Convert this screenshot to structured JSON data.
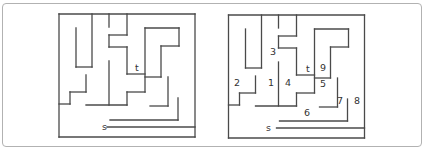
{
  "page": {
    "width": 425,
    "height": 150,
    "background_color": "#ffffff",
    "border_color": "#b2b2b2"
  },
  "figure": {
    "wall_color": "#4a4a4a",
    "wall_width": 1.3,
    "label_color": "#333333",
    "label_font_size": 9.5,
    "walls": [
      [
        59,
        14,
        195,
        14
      ],
      [
        59,
        14,
        59,
        137
      ],
      [
        195,
        14,
        195,
        137
      ],
      [
        59,
        137,
        195,
        137
      ],
      [
        76,
        28,
        76,
        67
      ],
      [
        92,
        14,
        92,
        67
      ],
      [
        76,
        67,
        92,
        67
      ],
      [
        109,
        14,
        109,
        27
      ],
      [
        127,
        14,
        127,
        35
      ],
      [
        109,
        35,
        127,
        35
      ],
      [
        109,
        35,
        109,
        47
      ],
      [
        109,
        47,
        127,
        47
      ],
      [
        127,
        47,
        127,
        74
      ],
      [
        109,
        61,
        109,
        105
      ],
      [
        127,
        74,
        145,
        74
      ],
      [
        145,
        28,
        145,
        92
      ],
      [
        145,
        28,
        179,
        28
      ],
      [
        179,
        28,
        179,
        46
      ],
      [
        161,
        46,
        179,
        46
      ],
      [
        161,
        46,
        161,
        77
      ],
      [
        145,
        77,
        161,
        77
      ],
      [
        70,
        92,
        86,
        92
      ],
      [
        86,
        75,
        86,
        92
      ],
      [
        70,
        92,
        70,
        104
      ],
      [
        59,
        104,
        70,
        104
      ],
      [
        86,
        105,
        127,
        105
      ],
      [
        127,
        92,
        127,
        105
      ],
      [
        127,
        92,
        145,
        92
      ],
      [
        150,
        106,
        168,
        106
      ],
      [
        168,
        77,
        168,
        106
      ],
      [
        110,
        120,
        178,
        120
      ],
      [
        178,
        98,
        178,
        120
      ],
      [
        107,
        127,
        195,
        127
      ]
    ],
    "left_maze": {
      "name": "maze-unlabeled",
      "dx": 0,
      "dy": 0,
      "labels": [
        {
          "id": "label-t-left",
          "text": "t",
          "x": 135,
          "y": 71
        },
        {
          "id": "label-s-left",
          "text": "s",
          "x": 102,
          "y": 130
        }
      ]
    },
    "right_maze": {
      "name": "maze-numbered",
      "dx": 169.5,
      "dy": 1,
      "labels": [
        {
          "id": "label-3",
          "text": "3",
          "x": 270,
          "y": 55
        },
        {
          "id": "label-2",
          "text": "2",
          "x": 234,
          "y": 86
        },
        {
          "id": "label-1",
          "text": "1",
          "x": 268,
          "y": 86
        },
        {
          "id": "label-4",
          "text": "4",
          "x": 285,
          "y": 86
        },
        {
          "id": "label-t-right",
          "text": "t",
          "x": 306,
          "y": 72
        },
        {
          "id": "label-9",
          "text": "9",
          "x": 320,
          "y": 71
        },
        {
          "id": "label-5",
          "text": "5",
          "x": 320,
          "y": 87
        },
        {
          "id": "label-7",
          "text": "7",
          "x": 337,
          "y": 104
        },
        {
          "id": "label-8",
          "text": "8",
          "x": 354,
          "y": 104
        },
        {
          "id": "label-6",
          "text": "6",
          "x": 304,
          "y": 116
        },
        {
          "id": "label-s-right",
          "text": "s",
          "x": 266,
          "y": 131
        }
      ]
    }
  }
}
